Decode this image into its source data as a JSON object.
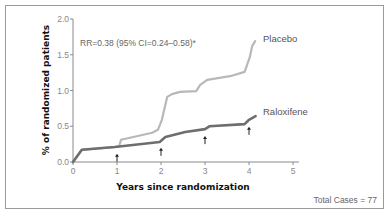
{
  "chart_data": {
    "type": "line",
    "title": "",
    "xlabel": "Years since randomization",
    "ylabel": "% of randomized patients",
    "xlim": [
      0,
      5
    ],
    "ylim": [
      0,
      2.0
    ],
    "x_ticks": [
      "0",
      "1",
      "2",
      "3",
      "4",
      "5"
    ],
    "y_ticks": [
      "0.0",
      "0.5",
      "1.0",
      "1.5",
      "2.0"
    ],
    "grid": false,
    "legend_position": "inline-right",
    "annotation": "RR=0.38 (95% CI=0.24–0.58)*",
    "footer": "Total Cases = 77",
    "arrows_at_x": [
      1,
      2,
      3,
      4
    ],
    "series": [
      {
        "name": "Placebo",
        "color": "#b8b8b8",
        "points": [
          [
            0,
            0
          ],
          [
            0.2,
            0.17
          ],
          [
            0.95,
            0.21
          ],
          [
            1.05,
            0.22
          ],
          [
            1.09,
            0.31
          ],
          [
            1.8,
            0.41
          ],
          [
            1.93,
            0.45
          ],
          [
            2.02,
            0.59
          ],
          [
            2.14,
            0.91
          ],
          [
            2.25,
            0.95
          ],
          [
            2.43,
            0.98
          ],
          [
            2.8,
            0.99
          ],
          [
            2.89,
            1.08
          ],
          [
            3.05,
            1.15
          ],
          [
            3.57,
            1.2
          ],
          [
            3.9,
            1.26
          ],
          [
            4.02,
            1.47
          ],
          [
            4.07,
            1.62
          ],
          [
            4.14,
            1.69
          ]
        ]
      },
      {
        "name": "Raloxifene",
        "color": "#6e6e6e",
        "points": [
          [
            0,
            0
          ],
          [
            0.2,
            0.17
          ],
          [
            0.95,
            0.21
          ],
          [
            1.97,
            0.28
          ],
          [
            2.1,
            0.35
          ],
          [
            2.55,
            0.42
          ],
          [
            3.0,
            0.46
          ],
          [
            3.1,
            0.5
          ],
          [
            3.9,
            0.53
          ],
          [
            4.0,
            0.59
          ],
          [
            4.15,
            0.64
          ]
        ]
      }
    ]
  }
}
